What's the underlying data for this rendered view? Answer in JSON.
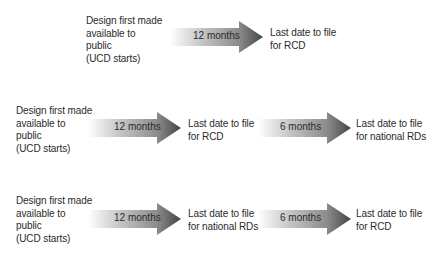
{
  "colors": {
    "arrow_start": "#ffffff",
    "arrow_mid": "#b5b5b5",
    "arrow_end": "#4a4a4a",
    "text": "#2b2b2b"
  },
  "rows": [
    {
      "start_label": "Design first made\navailable to\npublic\n(UCD starts)",
      "steps": [
        {
          "duration": "12 months",
          "end_label": "Last date to file\nfor RCD"
        }
      ]
    },
    {
      "start_label": "Design first made\navailable to\npublic\n(UCD starts)",
      "steps": [
        {
          "duration": "12 months",
          "end_label": "Last date to file\nfor RCD"
        },
        {
          "duration": "6 months",
          "end_label": "Last date to file\nfor national RDs"
        }
      ]
    },
    {
      "start_label": "Design first made\navailable to\npublic\n(UCD starts)",
      "steps": [
        {
          "duration": "12 months",
          "end_label": "Last date to file\nfor national RDs"
        },
        {
          "duration": "6 months",
          "end_label": "Last date to file\nfor RCD"
        }
      ]
    }
  ]
}
